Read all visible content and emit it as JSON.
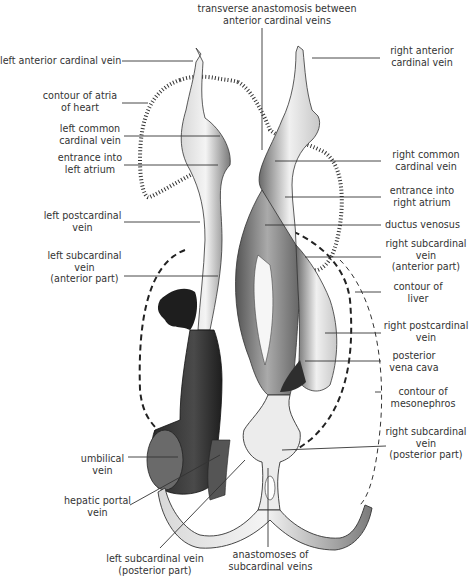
{
  "diagram": {
    "labels": {
      "transverse_anastomosis": [
        "transverse anastomosis between",
        "anterior cardinal veins"
      ],
      "left_anterior_cardinal": [
        "left anterior cardinal vein"
      ],
      "right_anterior_cardinal": [
        "right anterior",
        "cardinal vein"
      ],
      "contour_atria": [
        "contour of atria",
        "of heart"
      ],
      "left_common_cardinal": [
        "left common",
        "cardinal vein"
      ],
      "right_common_cardinal": [
        "right common",
        "cardinal vein"
      ],
      "entrance_left_atrium": [
        "entrance into",
        "left atrium"
      ],
      "entrance_right_atrium": [
        "entrance into",
        "right atrium"
      ],
      "ductus_venosus": [
        "ductus  venosus"
      ],
      "left_postcardinal": [
        "left postcardinal",
        "vein"
      ],
      "right_subcardinal_anterior": [
        "right subcardinal",
        "vein",
        "(anterior part)"
      ],
      "left_subcardinal_anterior": [
        "left subcardinal",
        "vein",
        "(anterior part)"
      ],
      "contour_liver": [
        "contour of",
        "liver"
      ],
      "right_postcardinal": [
        "right postcardinal",
        "vein"
      ],
      "posterior_vena_cava": [
        "posterior",
        "vena cava"
      ],
      "contour_mesonephros": [
        "contour of",
        "mesonephros"
      ],
      "umbilical_vein": [
        "umbilical",
        "vein"
      ],
      "right_subcardinal_posterior": [
        "right subcardinal",
        "vein",
        "(posterior part)"
      ],
      "hepatic_portal": [
        "hepatic portal",
        "vein"
      ],
      "left_subcardinal_posterior": [
        "left subcardinal vein",
        "(posterior part)"
      ],
      "anastomoses_subcardinal": [
        "anastomoses of",
        "subcardinal veins"
      ]
    },
    "colors": {
      "ink": "#2a2a2a",
      "vessel_light": "#e8e8e8",
      "vessel_mid": "#9a9a9a",
      "vessel_dark": "#3a3a3a"
    }
  }
}
